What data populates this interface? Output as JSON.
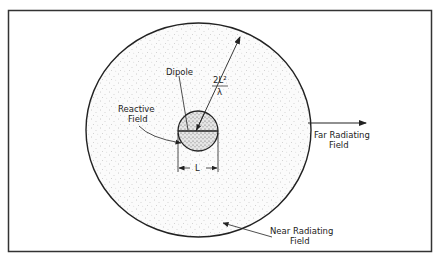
{
  "diagram": {
    "labels": {
      "dipole": "Dipole",
      "reactive_line1": "Reactive",
      "reactive_line2": "Field",
      "radius_numerator": "2L²",
      "radius_denominator": "λ",
      "length": "L",
      "far_line1": "Far Radiating",
      "far_line2": "Field",
      "near_line1": "Near Radiating",
      "near_line2": "Field"
    },
    "colors": {
      "stroke": "#222222",
      "background": "#ffffff",
      "stipple": "#9a9a9a"
    }
  }
}
